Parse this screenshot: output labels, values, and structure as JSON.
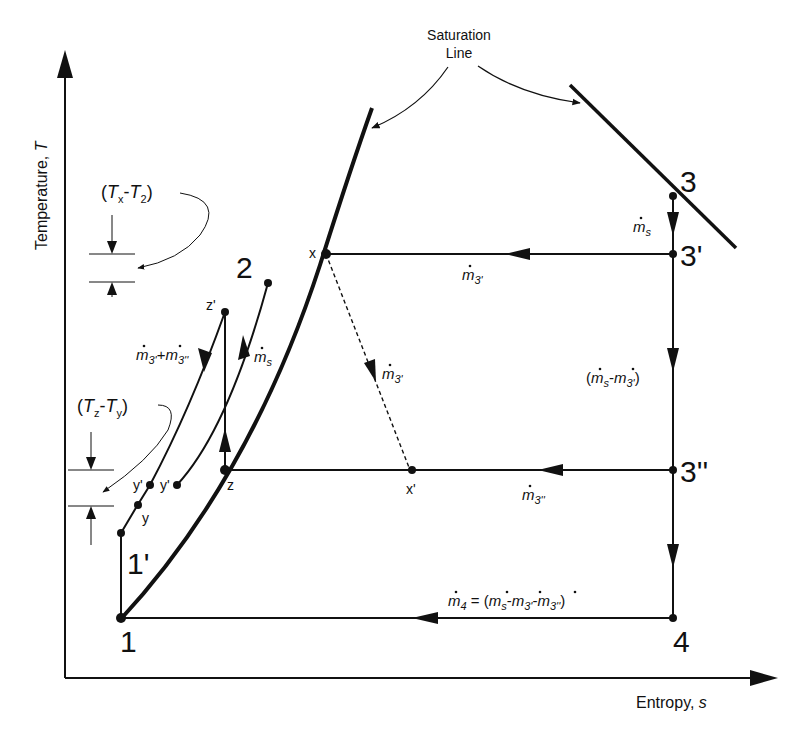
{
  "diagram": {
    "type": "T-s diagram (multi-pressure heat recovery cycle)",
    "axes": {
      "y_label": "Temperature, ",
      "y_symbol": "T",
      "x_label": "Entropy, ",
      "x_symbol": "s"
    },
    "saturation_callout": {
      "line1": "Saturation",
      "line2": "Line"
    },
    "state_points": {
      "p1": "1",
      "p1prime": "1'",
      "p2": "2",
      "p3": "3",
      "p3prime": "3'",
      "p3dprime": "3''",
      "p4": "4",
      "x": "x",
      "xprime": "x'",
      "z": "z",
      "zprime": "z'",
      "y": "y",
      "yprime_left": "y'",
      "yprime_right": "y'"
    },
    "flow_labels": {
      "ms_top": {
        "m": "m",
        "sub": "s"
      },
      "m3prime_top": {
        "m": "m",
        "sub": "3'"
      },
      "m3prime_dashed": {
        "m": "m",
        "sub": "3'"
      },
      "ms_minus_m3prime": {
        "open": "(",
        "m1": "m",
        "sub1": "s",
        "minus": "-",
        "m2": "m",
        "sub2": "3'",
        "close": ")"
      },
      "m3dprime": {
        "m": "m",
        "sub": "3''"
      },
      "m4_eq": {
        "m4": "m",
        "sub4": "4",
        "eq": " = (",
        "m1": "m",
        "sub1": "s",
        "minus1": "-",
        "m2": "m",
        "sub2": "3'",
        "minus2": "-",
        "m3": "m",
        "sub3": "3''",
        "close": ")"
      },
      "ms_left": {
        "m": "m",
        "sub": "s"
      },
      "m3p_plus_m3dp": {
        "m1": "m",
        "sub1": "3'",
        "plus": "+",
        "m2": "m",
        "sub2": "3''"
      }
    },
    "pinch_notes": {
      "tx_t2": {
        "open": "(",
        "T1": "T",
        "sub1": "x",
        "dash": "-",
        "T2": "T",
        "sub2": "2",
        "close": ")"
      },
      "tz_ty": {
        "open": "(",
        "T1": "T",
        "sub1": "z",
        "dash": "-",
        "T2": "T",
        "sub2": "y",
        "close": ")"
      }
    }
  }
}
